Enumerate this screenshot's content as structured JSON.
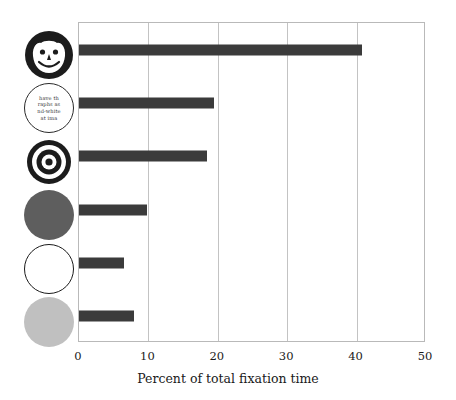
{
  "chart_data": {
    "type": "bar",
    "orientation": "horizontal",
    "title": "",
    "xlabel": "Percent of total fixation time",
    "ylabel": "",
    "xlim": [
      0,
      50
    ],
    "xticks": [
      "0",
      "10",
      "20",
      "30",
      "40",
      "50"
    ],
    "grid": true,
    "legend": "none",
    "bar_color": "#3b3b3b",
    "categories": [
      "smiley-face-image",
      "text-paragraph-image",
      "bullseye-image",
      "dark-gray-disk-image",
      "white-disk-image",
      "light-gray-disk-image"
    ],
    "values": [
      41.0,
      19.5,
      18.6,
      9.8,
      6.5,
      8.0
    ]
  },
  "axis": {
    "x_title": "Percent of total fixation time",
    "ticks": [
      {
        "label": "0",
        "value": 0
      },
      {
        "label": "10",
        "value": 10
      },
      {
        "label": "20",
        "value": 20
      },
      {
        "label": "30",
        "value": 30
      },
      {
        "label": "40",
        "value": 40
      },
      {
        "label": "50",
        "value": 50
      }
    ]
  },
  "icons": [
    {
      "name": "smiley-face-icon",
      "type": "smiley",
      "description": "cartoon smiling face with dark hair"
    },
    {
      "name": "text-circle-icon",
      "type": "text",
      "description": "circle filled with small text",
      "lines": [
        "have th",
        "raphs  as",
        "nd-white",
        "at ima"
      ]
    },
    {
      "name": "bullseye-icon",
      "type": "bullseye",
      "description": "concentric black and white rings"
    },
    {
      "name": "dark-gray-circle-icon",
      "type": "disk",
      "fill": "#5e5e5e"
    },
    {
      "name": "white-circle-icon",
      "type": "disk-outline",
      "fill": "#ffffff"
    },
    {
      "name": "light-gray-circle-icon",
      "type": "disk",
      "fill": "#c0c0c0"
    }
  ]
}
